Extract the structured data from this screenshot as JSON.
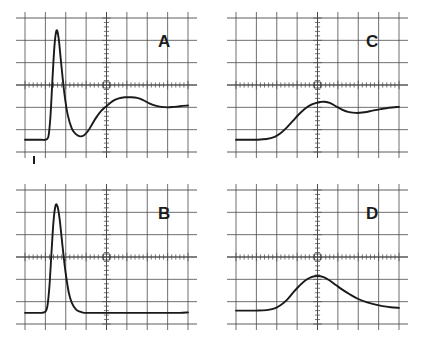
{
  "figure": {
    "kind": "oscilloscope-trace-panels",
    "panel_count": 4,
    "background_color": "#ffffff",
    "grid_color": "#4a4a4a",
    "trace_color": "#1a1a1a",
    "label_color": "#1c1c1c"
  },
  "grid": {
    "columns": 8,
    "rows": 6,
    "minor_ticks_per_division": 5,
    "center_axes": "crosshair",
    "axis_ticks_visible": true,
    "frame_style": "open"
  },
  "panels": [
    {
      "id": "A",
      "label": "A",
      "position": "top-left",
      "has_marker": true,
      "marker_name": "trigger-marker",
      "description": "tall narrow spike with undershoot then damped overshoot ringing"
    },
    {
      "id": "B",
      "label": "B",
      "position": "bottom-left",
      "has_marker": false,
      "description": "tall narrow spike decaying cleanly to flat baseline"
    },
    {
      "id": "C",
      "label": "C",
      "position": "top-right",
      "has_marker": false,
      "description": "slow S-shaped rise with small hump past center then slight dip"
    },
    {
      "id": "D",
      "label": "D",
      "position": "bottom-right",
      "has_marker": false,
      "description": "broad symmetric hump peaking at center axis with gradual decay"
    }
  ],
  "chart_data": {
    "type": "line",
    "title": "",
    "xlabel": "",
    "ylabel": "",
    "grid": true,
    "legend_position": "in-panel-top-right",
    "axis_ranges": {
      "x": [
        0,
        8
      ],
      "y": [
        -3,
        3
      ]
    },
    "panel_layout": {
      "rows": 2,
      "cols": 2,
      "order": [
        "A",
        "C",
        "B",
        "D"
      ]
    },
    "series": [
      {
        "name": "A",
        "baseline_y": -2.45,
        "peak_x": 1.55,
        "peak_y": 2.45,
        "undershoot_y": -2.3,
        "x": [
          0.0,
          0.4,
          0.8,
          1.0,
          1.15,
          1.25,
          1.35,
          1.45,
          1.55,
          1.65,
          1.75,
          1.85,
          1.95,
          2.1,
          2.3,
          2.5,
          2.7,
          2.9,
          3.1,
          3.3,
          3.5,
          3.75,
          4.0,
          4.3,
          4.6,
          4.9,
          5.2,
          5.5,
          5.8,
          6.1,
          6.4,
          6.7,
          7.0,
          7.3,
          7.6,
          8.0
        ],
        "y": [
          -2.45,
          -2.45,
          -2.45,
          -2.45,
          -2.3,
          -1.4,
          0.3,
          1.8,
          2.45,
          2.1,
          1.2,
          0.3,
          -0.5,
          -1.35,
          -1.95,
          -2.2,
          -2.3,
          -2.25,
          -2.05,
          -1.75,
          -1.45,
          -1.15,
          -0.95,
          -0.72,
          -0.6,
          -0.55,
          -0.55,
          -0.58,
          -0.68,
          -0.82,
          -0.92,
          -0.98,
          -1.0,
          -0.98,
          -0.95,
          -0.92
        ]
      },
      {
        "name": "B",
        "baseline_y": -2.5,
        "peak_x": 1.5,
        "peak_y": 2.3,
        "x": [
          0.0,
          0.4,
          0.8,
          1.0,
          1.1,
          1.2,
          1.3,
          1.4,
          1.5,
          1.6,
          1.7,
          1.8,
          1.9,
          2.0,
          2.15,
          2.3,
          2.5,
          2.7,
          2.9,
          3.2,
          3.6,
          4.0,
          4.6,
          5.2,
          5.8,
          6.4,
          7.0,
          7.6,
          8.0
        ],
        "y": [
          -2.5,
          -2.5,
          -2.5,
          -2.45,
          -2.2,
          -1.3,
          0.2,
          1.6,
          2.3,
          2.25,
          1.7,
          0.85,
          0.0,
          -0.75,
          -1.6,
          -2.05,
          -2.35,
          -2.45,
          -2.5,
          -2.5,
          -2.5,
          -2.5,
          -2.5,
          -2.5,
          -2.5,
          -2.5,
          -2.5,
          -2.5,
          -2.48
        ]
      },
      {
        "name": "C",
        "baseline_y": -2.45,
        "peak_x": 4.35,
        "peak_y": -0.75,
        "x": [
          0.0,
          0.5,
          1.0,
          1.5,
          1.9,
          2.2,
          2.5,
          2.8,
          3.1,
          3.4,
          3.7,
          3.95,
          4.15,
          4.35,
          4.6,
          4.9,
          5.2,
          5.5,
          5.9,
          6.3,
          6.7,
          7.1,
          7.5,
          8.0
        ],
        "y": [
          -2.45,
          -2.45,
          -2.45,
          -2.42,
          -2.32,
          -2.15,
          -1.9,
          -1.6,
          -1.3,
          -1.05,
          -0.88,
          -0.8,
          -0.76,
          -0.75,
          -0.8,
          -0.95,
          -1.1,
          -1.2,
          -1.25,
          -1.22,
          -1.15,
          -1.08,
          -1.02,
          -0.98
        ]
      },
      {
        "name": "D",
        "baseline_y": -2.4,
        "peak_x": 4.0,
        "peak_y": -0.85,
        "x": [
          0.0,
          0.5,
          1.0,
          1.5,
          1.9,
          2.2,
          2.5,
          2.8,
          3.1,
          3.4,
          3.7,
          4.0,
          4.3,
          4.6,
          4.9,
          5.2,
          5.6,
          6.0,
          6.4,
          6.8,
          7.2,
          7.6,
          8.0
        ],
        "y": [
          -2.4,
          -2.4,
          -2.4,
          -2.38,
          -2.3,
          -2.15,
          -1.92,
          -1.6,
          -1.3,
          -1.05,
          -0.9,
          -0.85,
          -0.9,
          -1.05,
          -1.25,
          -1.45,
          -1.68,
          -1.88,
          -2.02,
          -2.12,
          -2.2,
          -2.25,
          -2.28
        ]
      }
    ]
  }
}
